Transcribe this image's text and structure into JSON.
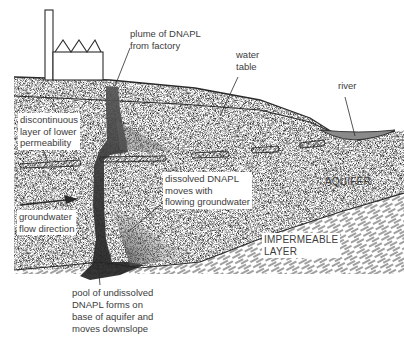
{
  "diagram": {
    "type": "cross-section",
    "labels": {
      "plume": [
        "plume of DNAPL",
        "from factory"
      ],
      "water_table": [
        "water",
        "table"
      ],
      "river": "river",
      "discontinuous_layer": [
        "discontinuous",
        "layer of lower",
        "permeability"
      ],
      "dissolved": [
        "dissolved DNAPL",
        "moves with",
        "flowing groundwater"
      ],
      "aquifer": "AQUIFER",
      "flow_direction": [
        "groundwater",
        "flow direction"
      ],
      "impermeable": [
        "IMPERMEABLE",
        "LAYER"
      ],
      "pool": [
        "pool of undissolved",
        "DNAPL forms on",
        "base of aquifer and",
        "moves downslope"
      ]
    },
    "colors": {
      "line": "#2a2a2a",
      "stipple": "#9a9a9a",
      "plume": "#3a3a3a",
      "river": "#7a7a7a",
      "background": "#ffffff"
    }
  }
}
